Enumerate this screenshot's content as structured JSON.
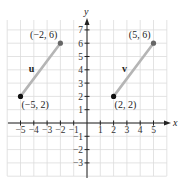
{
  "diagram": {
    "type": "coordinate-plane-vectors",
    "axes": {
      "x_label": "x",
      "y_label": "y",
      "x_ticks": [
        "-5",
        "-4",
        "-3",
        "-2",
        "-1",
        "1",
        "2",
        "3",
        "4",
        "5"
      ],
      "y_ticks": [
        "7",
        "6",
        "5",
        "4",
        "3",
        "2",
        "1",
        "-1",
        "-2",
        "-3"
      ],
      "x_range": [
        -6,
        6
      ],
      "y_range": [
        -4,
        7.7
      ]
    },
    "vectors": [
      {
        "name": "u",
        "start": [
          -5,
          2
        ],
        "end": [
          -2,
          6
        ],
        "start_label": "(−5, 2)",
        "end_label": "(−2, 6)"
      },
      {
        "name": "v",
        "start": [
          2,
          2
        ],
        "end": [
          5,
          6
        ],
        "start_label": "(2, 2)",
        "end_label": "(5, 6)"
      }
    ],
    "colors": {
      "grid": "#dcdcdc",
      "axis": "#222222",
      "vector": "#b5b5b5",
      "point_start": "#111111",
      "point_end": "#666666"
    }
  }
}
